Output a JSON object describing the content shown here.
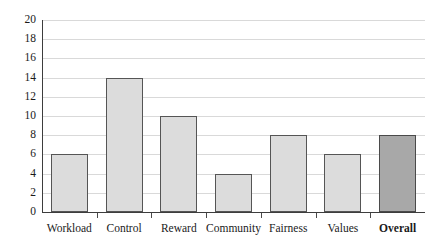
{
  "chart_data": {
    "type": "bar",
    "title": "",
    "subtitle": "",
    "xlabel": "",
    "ylabel": "",
    "categories": [
      "Workload",
      "Control",
      "Reward",
      "Community",
      "Fairness",
      "Values",
      "Overall"
    ],
    "values": [
      6,
      14,
      10,
      4,
      8,
      6,
      8
    ],
    "series": [
      {
        "name": "Score",
        "values": [
          6,
          14,
          10,
          4,
          8,
          6,
          8
        ]
      }
    ],
    "ylim": [
      0,
      20
    ],
    "y_ticks": [
      0,
      2,
      4,
      6,
      8,
      10,
      12,
      14,
      16,
      18,
      20
    ],
    "y_tick_labels": [
      "0",
      "2",
      "4",
      "6",
      "8",
      "10",
      "12",
      "14",
      "16",
      "18",
      "20"
    ],
    "grid": true,
    "grid_axis": "y",
    "legend": false,
    "legend_position": "none",
    "highlight_category": "Overall",
    "bar_colors": {
      "default_fill": "#dcdcdc",
      "default_border": "#555555",
      "highlight_fill": "#a8a8a8",
      "highlight_border": "#4a4a4a"
    },
    "grid_color": "#d9d9d9",
    "axis_color": "#3d3d3d",
    "text_color": "#1a1a1a",
    "background": "#ffffff",
    "bold_categories": [
      "Overall"
    ],
    "annotations": []
  }
}
